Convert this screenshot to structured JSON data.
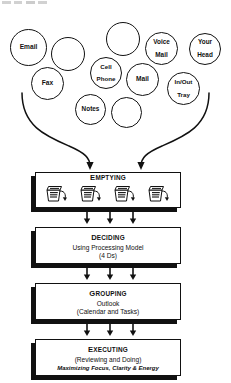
{
  "diagram": {
    "line_color": "#111111",
    "fill_color": "#ffffff"
  },
  "inputs": {
    "label": "input sources funneled into the process",
    "circles": [
      {
        "id": "email",
        "label": "Email",
        "lines": [
          "Email"
        ]
      },
      {
        "id": "blank-1",
        "label": "",
        "lines": []
      },
      {
        "id": "blank-2",
        "label": "",
        "lines": []
      },
      {
        "id": "voice-mail",
        "label": "Voice Mail",
        "lines": [
          "Voice",
          "Mail"
        ]
      },
      {
        "id": "your-head",
        "label": "Your Head",
        "lines": [
          "Your",
          "Head"
        ]
      },
      {
        "id": "fax",
        "label": "Fax",
        "lines": [
          "Fax"
        ]
      },
      {
        "id": "cell-phone",
        "label": "Cell Phone",
        "lines": [
          "Cell",
          "Phone"
        ]
      },
      {
        "id": "mail",
        "label": "Mail",
        "lines": [
          "Mail"
        ]
      },
      {
        "id": "in-out-tray",
        "label": "In/Out Tray",
        "lines": [
          "In/Out",
          "Tray"
        ]
      },
      {
        "id": "notes",
        "label": "Notes",
        "lines": [
          "Notes"
        ]
      },
      {
        "id": "blank-3",
        "label": "",
        "lines": []
      }
    ]
  },
  "stages": [
    {
      "id": "emptying",
      "title": "EMPTYING",
      "title_cap": "E",
      "title_rest": "MPTYING",
      "lines": [],
      "icons": [
        "in-tray-icon",
        "in-tray-icon",
        "in-tray-icon",
        "in-tray-icon"
      ]
    },
    {
      "id": "deciding",
      "title": "DECIDING",
      "title_cap": "D",
      "title_rest": "ECIDING",
      "lines": [
        "Using Processing Model",
        "(4 Ds)"
      ],
      "icons": []
    },
    {
      "id": "grouping",
      "title": "GROUPING",
      "title_cap": "G",
      "title_rest": "ROUPING",
      "lines": [
        "Outlook",
        "(Calendar and Tasks)"
      ],
      "icons": []
    },
    {
      "id": "executing",
      "title": "EXECUTING",
      "title_cap": "E",
      "title_rest": "XECUTING",
      "lines": [
        "(Reviewing and Doing)"
      ],
      "italic_line": "Maximizing Focus, Clarity & Energy",
      "icons": []
    }
  ],
  "connectors": {
    "funnel_arrows": 2,
    "between_stage_arrows": 3
  }
}
